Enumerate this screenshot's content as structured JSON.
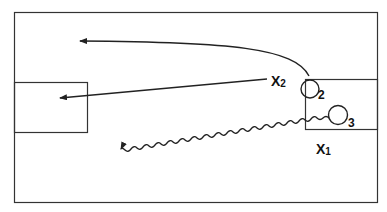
{
  "diagram": {
    "type": "play-diagram",
    "colors": {
      "line": "#222222",
      "background": "#ffffff"
    },
    "players": [
      {
        "id": "X2",
        "label": "X",
        "sub": "2",
        "role": "defender"
      },
      {
        "id": "X1",
        "label": "X",
        "sub": "1",
        "role": "defender"
      },
      {
        "id": "2",
        "label": "2",
        "role": "attacker"
      },
      {
        "id": "3",
        "label": "3",
        "role": "attacker"
      }
    ],
    "movements": [
      {
        "from": "2",
        "type": "run",
        "style": "curved-arrow",
        "direction": "left"
      },
      {
        "from": "X2",
        "type": "pass",
        "style": "straight-arrow",
        "direction": "left-into-box"
      },
      {
        "from": "3",
        "type": "dribble",
        "style": "wavy-arrow",
        "direction": "left"
      }
    ],
    "areas": [
      "field-boundary",
      "left-penalty-box",
      "right-penalty-box"
    ]
  }
}
